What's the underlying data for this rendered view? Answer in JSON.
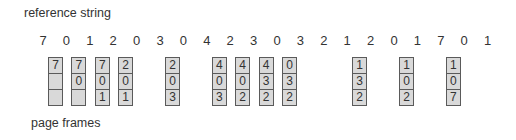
{
  "labels": {
    "reference_string": "reference string",
    "page_frames": "page frames"
  },
  "reference_string": [
    "7",
    "0",
    "1",
    "2",
    "0",
    "3",
    "0",
    "4",
    "2",
    "3",
    "0",
    "3",
    "2",
    "1",
    "2",
    "0",
    "1",
    "7",
    "0",
    "1"
  ],
  "frames": [
    {
      "index": 0,
      "cells": [
        "7",
        "",
        ""
      ]
    },
    {
      "index": 1,
      "cells": [
        "7",
        "0",
        ""
      ]
    },
    {
      "index": 2,
      "cells": [
        "7",
        "0",
        "1"
      ]
    },
    {
      "index": 3,
      "cells": [
        "2",
        "0",
        "1"
      ]
    },
    {
      "index": 5,
      "cells": [
        "2",
        "0",
        "3"
      ]
    },
    {
      "index": 7,
      "cells": [
        "4",
        "0",
        "3"
      ]
    },
    {
      "index": 8,
      "cells": [
        "4",
        "0",
        "2"
      ]
    },
    {
      "index": 9,
      "cells": [
        "4",
        "3",
        "2"
      ]
    },
    {
      "index": 10,
      "cells": [
        "0",
        "3",
        "2"
      ]
    },
    {
      "index": 13,
      "cells": [
        "1",
        "3",
        "2"
      ]
    },
    {
      "index": 15,
      "cells": [
        "1",
        "0",
        "2"
      ]
    },
    {
      "index": 17,
      "cells": [
        "1",
        "0",
        "7"
      ]
    }
  ]
}
